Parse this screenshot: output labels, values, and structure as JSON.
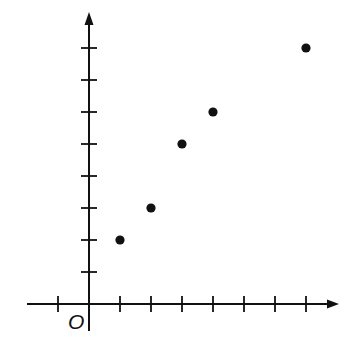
{
  "chart_data": {
    "type": "scatter",
    "title": "",
    "xlabel": "",
    "ylabel": "",
    "origin_label": "O",
    "x": [
      1,
      2,
      3,
      4,
      7
    ],
    "y": [
      2,
      3,
      5,
      6,
      8
    ],
    "points": [
      {
        "x": 1,
        "y": 2
      },
      {
        "x": 2,
        "y": 3
      },
      {
        "x": 3,
        "y": 5
      },
      {
        "x": 4,
        "y": 6
      },
      {
        "x": 7,
        "y": 8
      }
    ],
    "xlim": [
      -2,
      8
    ],
    "ylim": [
      -1,
      9
    ],
    "x_ticks": [
      -1,
      1,
      2,
      3,
      4,
      5,
      6,
      7
    ],
    "y_ticks": [
      1,
      2,
      3,
      4,
      5,
      6,
      7,
      8
    ],
    "tick_labels_shown": false,
    "grid": false,
    "legend": null,
    "colors": {
      "axis": "#111111",
      "point": "#111111",
      "background": "#ffffff"
    }
  }
}
